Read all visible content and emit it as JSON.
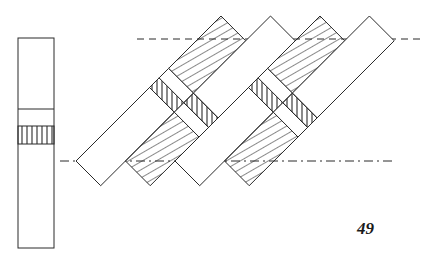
{
  "figure": {
    "number": "49",
    "type": "weave / strip-crossing technical drawing"
  },
  "colors": {
    "line": "#2a2a2a",
    "background": "#ffffff"
  },
  "elevation_bar": {
    "label": "side elevation strip",
    "divider_line": true,
    "hatched_band_lines": 6
  },
  "guide_lines": [
    {
      "name": "top-dashed-guide",
      "style": "dashed"
    },
    {
      "name": "bottom-dash-dot-guide",
      "style": "dash-dot"
    }
  ],
  "strip_groups": [
    {
      "name": "group-1",
      "strips": [
        {
          "lower": "plain",
          "upper": "diagonal-hatch"
        },
        {
          "lower": "diagonal-hatch",
          "upper": "plain"
        }
      ],
      "cross_band": [
        [
          "vertical-hatch",
          "plain"
        ],
        [
          "plain",
          "vertical-hatch"
        ]
      ]
    },
    {
      "name": "group-2",
      "strips": [
        {
          "lower": "plain",
          "upper": "diagonal-hatch"
        },
        {
          "lower": "diagonal-hatch",
          "upper": "plain"
        }
      ],
      "cross_band": [
        [
          "vertical-hatch",
          "plain"
        ],
        [
          "plain",
          "vertical-hatch"
        ]
      ]
    }
  ]
}
